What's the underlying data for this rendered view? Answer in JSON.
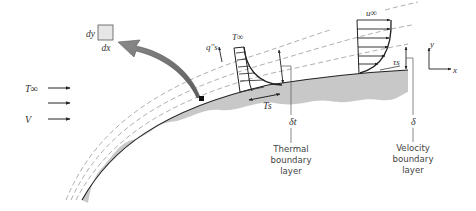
{
  "figure": {
    "differential_element": {
      "width_label": "dx",
      "height_label": "dy"
    },
    "freestream": {
      "temperature_label": "T∞",
      "velocity_label": "V",
      "arrow_count": 3
    },
    "thermal_profile": {
      "freestream_label": "T∞",
      "surface_label": "Ts",
      "heat_flux_label": "q''s",
      "thickness_label": "δt",
      "caption": [
        "Thermal",
        "boundary",
        "layer"
      ]
    },
    "velocity_profile": {
      "freestream_label": "u∞",
      "shear_label": "τs",
      "thickness_label": "δ",
      "caption": [
        "Velocity",
        "boundary",
        "layer"
      ]
    },
    "axes": {
      "x_label": "x",
      "y_label": "y"
    },
    "colors": {
      "surface_fill": "#c8c8c8",
      "element_fill": "#e6e6e6",
      "curved_arrow_fill": "#7a7a7a",
      "line": "#222222",
      "dashed": "#9a9a9a"
    }
  }
}
